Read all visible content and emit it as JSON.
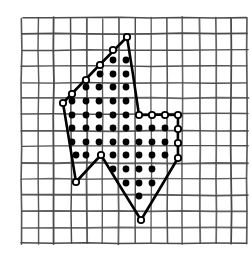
{
  "figure": {
    "canvas": {
      "width": 251,
      "height": 256,
      "background": "#ffffff"
    },
    "colors": {
      "grid_line": "#4a4a4a",
      "polygon_stroke": "#000000",
      "interior_dot_fill": "#000000",
      "boundary_dot_fill": "#ffffff",
      "boundary_dot_stroke": "#000000"
    },
    "grid": {
      "origin_x": 22,
      "origin_y": 18,
      "spacing": 16.1,
      "columns": 14,
      "rows": 14,
      "stroke_width": 1.6,
      "visible": true,
      "hand_drawn": true
    },
    "lattice": {
      "origin_x": 72,
      "origin_y": 60,
      "spacing_x": 13.3,
      "spacing_y": 13.55,
      "interior_dot_radius": 3.4,
      "boundary_dot_radius": 3.2
    },
    "polygon": {
      "stroke_width": 2.6,
      "closed": true,
      "vertices": [
        {
          "name": "top-apex",
          "x": 127,
          "y": 37
        },
        {
          "name": "upper-right-shoulder",
          "x": 139,
          "y": 115
        },
        {
          "name": "right-ledge-end",
          "x": 178,
          "y": 115
        },
        {
          "name": "right-lower",
          "x": 178,
          "y": 158
        },
        {
          "name": "bottom-apex",
          "x": 141,
          "y": 220
        },
        {
          "name": "notch-peak",
          "x": 101,
          "y": 155
        },
        {
          "name": "lower-left",
          "x": 76,
          "y": 182
        },
        {
          "name": "left-vertex",
          "x": 63,
          "y": 103
        }
      ]
    },
    "boundary_points": [
      {
        "x": 127,
        "y": 37
      },
      {
        "x": 113,
        "y": 50
      },
      {
        "x": 100,
        "y": 65
      },
      {
        "x": 86,
        "y": 80
      },
      {
        "x": 72,
        "y": 94
      },
      {
        "x": 63,
        "y": 103
      },
      {
        "x": 139,
        "y": 115
      },
      {
        "x": 152,
        "y": 115
      },
      {
        "x": 165,
        "y": 115
      },
      {
        "x": 178,
        "y": 115
      },
      {
        "x": 178,
        "y": 129
      },
      {
        "x": 178,
        "y": 143
      },
      {
        "x": 178,
        "y": 158
      },
      {
        "x": 141,
        "y": 220
      },
      {
        "x": 101,
        "y": 155
      },
      {
        "x": 76,
        "y": 182
      }
    ],
    "interior_points": [
      {
        "x": 113,
        "y": 60
      },
      {
        "x": 126,
        "y": 60
      },
      {
        "x": 100,
        "y": 74
      },
      {
        "x": 113,
        "y": 74
      },
      {
        "x": 126,
        "y": 74
      },
      {
        "x": 86,
        "y": 87
      },
      {
        "x": 99,
        "y": 87
      },
      {
        "x": 113,
        "y": 87
      },
      {
        "x": 126,
        "y": 87
      },
      {
        "x": 86,
        "y": 101
      },
      {
        "x": 99,
        "y": 101
      },
      {
        "x": 113,
        "y": 101
      },
      {
        "x": 126,
        "y": 101
      },
      {
        "x": 72,
        "y": 101
      },
      {
        "x": 72,
        "y": 115
      },
      {
        "x": 86,
        "y": 115
      },
      {
        "x": 99,
        "y": 115
      },
      {
        "x": 113,
        "y": 115
      },
      {
        "x": 126,
        "y": 115
      },
      {
        "x": 72,
        "y": 128
      },
      {
        "x": 86,
        "y": 128
      },
      {
        "x": 99,
        "y": 128
      },
      {
        "x": 113,
        "y": 128
      },
      {
        "x": 126,
        "y": 128
      },
      {
        "x": 139,
        "y": 128
      },
      {
        "x": 152,
        "y": 128
      },
      {
        "x": 165,
        "y": 128
      },
      {
        "x": 72,
        "y": 142
      },
      {
        "x": 86,
        "y": 142
      },
      {
        "x": 99,
        "y": 142
      },
      {
        "x": 113,
        "y": 142
      },
      {
        "x": 126,
        "y": 142
      },
      {
        "x": 139,
        "y": 142
      },
      {
        "x": 152,
        "y": 142
      },
      {
        "x": 165,
        "y": 142
      },
      {
        "x": 76,
        "y": 155
      },
      {
        "x": 86,
        "y": 155
      },
      {
        "x": 113,
        "y": 155
      },
      {
        "x": 126,
        "y": 155
      },
      {
        "x": 139,
        "y": 155
      },
      {
        "x": 152,
        "y": 155
      },
      {
        "x": 165,
        "y": 155
      },
      {
        "x": 113,
        "y": 169
      },
      {
        "x": 126,
        "y": 169
      },
      {
        "x": 139,
        "y": 169
      },
      {
        "x": 152,
        "y": 169
      },
      {
        "x": 126,
        "y": 183
      },
      {
        "x": 139,
        "y": 183
      },
      {
        "x": 152,
        "y": 183
      },
      {
        "x": 139,
        "y": 196
      }
    ]
  }
}
